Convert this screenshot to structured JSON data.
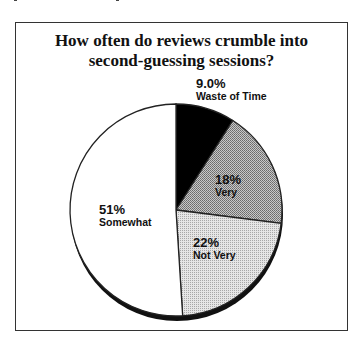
{
  "chart_data": {
    "type": "pie",
    "title": "How often do reviews crumble into second-guessing sessions?",
    "title_lines": [
      "How often do reviews crumble into",
      "second-guessing sessions?"
    ],
    "slices": [
      {
        "label": "Waste of Time",
        "value": 9.0,
        "display": "9.0%",
        "fill": "#000000"
      },
      {
        "label": "Very",
        "value": 18,
        "display": "18%",
        "fill": "#a0a0a0"
      },
      {
        "label": "Not Very",
        "value": 22,
        "display": "22%",
        "fill": "#d2d2d2"
      },
      {
        "label": "Somewhat",
        "value": 51,
        "display": "51%",
        "fill": "#ffffff"
      }
    ],
    "start_angle": "12 o'clock, clockwise",
    "legend": "none (labels on/near slices)"
  }
}
